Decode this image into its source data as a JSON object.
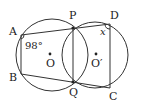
{
  "diagram": {
    "points": {
      "A": {
        "label": "A",
        "x": 21,
        "y": 34
      },
      "B": {
        "label": "B",
        "x": 21,
        "y": 74
      },
      "P": {
        "label": "P",
        "x": 73,
        "y": 28
      },
      "Q": {
        "label": "Q",
        "x": 73,
        "y": 82
      },
      "D": {
        "label": "D",
        "x": 110,
        "y": 24
      },
      "C": {
        "label": "C",
        "x": 110,
        "y": 88
      },
      "O": {
        "label": "O",
        "x": 50,
        "y": 54
      },
      "O2": {
        "label": "O′",
        "x": 96,
        "y": 54
      }
    },
    "circles": [
      {
        "name": "circle-O",
        "cx": 52,
        "cy": 55,
        "r": 36
      },
      {
        "name": "circle-O-prime",
        "cx": 95,
        "cy": 55,
        "r": 33
      }
    ],
    "angles": {
      "A": "98°",
      "D": "x"
    },
    "stroke_color": "#333333"
  }
}
